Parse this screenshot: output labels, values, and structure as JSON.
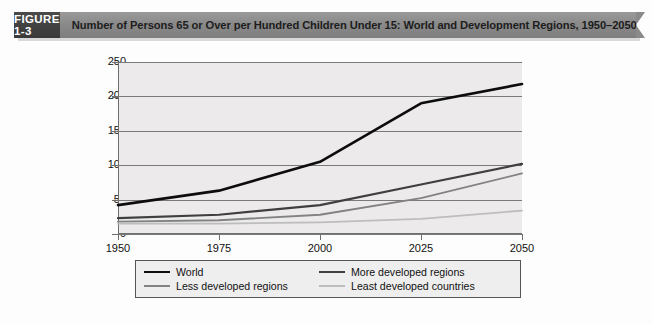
{
  "header": {
    "figure_tag": "FIGURE 1-3",
    "title": "Number of Persons 65 or Over per Hundred Children Under 15: World and Development Regions, 1950–2050"
  },
  "chart_data": {
    "type": "line",
    "title": "Number of Persons 65 or Over per Hundred Children Under 15: World and Development Regions, 1950–2050",
    "xlabel": "",
    "ylabel": "",
    "x": [
      1950,
      1975,
      2000,
      2025,
      2050
    ],
    "categories": [
      "1950",
      "1975",
      "2000",
      "2025",
      "2050"
    ],
    "xlim": [
      1950,
      2050
    ],
    "ylim": [
      0,
      250
    ],
    "yticks": [
      0,
      50,
      100,
      150,
      200,
      250
    ],
    "xticks": [
      1950,
      1975,
      2000,
      2025,
      2050
    ],
    "grid": "horizontal",
    "legend_position": "bottom",
    "series": [
      {
        "name": "World",
        "color": "#0d0d0d",
        "width": 2.6,
        "values": [
          42,
          63,
          105,
          190,
          218
        ]
      },
      {
        "name": "More developed regions",
        "color": "#3f3f3f",
        "width": 2.2,
        "values": [
          23,
          28,
          42,
          72,
          102
        ]
      },
      {
        "name": "Less developed regions",
        "color": "#828282",
        "width": 1.8,
        "values": [
          18,
          20,
          28,
          52,
          88
        ]
      },
      {
        "name": "Least developed countries",
        "color": "#bdbdbd",
        "width": 1.8,
        "values": [
          15,
          15,
          17,
          22,
          34
        ]
      }
    ]
  },
  "legend": {
    "items": [
      {
        "label": "World",
        "swatch": "line-swatch-world"
      },
      {
        "label": "More developed regions",
        "swatch": "line-swatch-more-developed"
      },
      {
        "label": "Less developed regions",
        "swatch": "line-swatch-less-developed"
      },
      {
        "label": "Least developed countries",
        "swatch": "line-swatch-least-developed"
      }
    ]
  },
  "axis": {
    "y_labels": [
      "250",
      "200",
      "150",
      "100",
      "50",
      "0"
    ],
    "x_labels": [
      "1950",
      "1975",
      "2000",
      "2025",
      "2050"
    ]
  }
}
